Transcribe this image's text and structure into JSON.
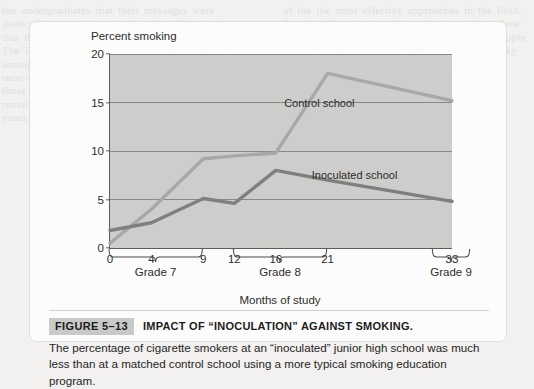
{
  "figure": {
    "number": "FIGURE 5–13",
    "title": "IMPACT OF “INOCULATION” AGAINST SMOKING.",
    "caption": "The percentage of cigarette smokers at an “inoculated” junior high school was much less than at a matched control school using a more typical smoking education program."
  },
  "chart_data": {
    "type": "line",
    "title": "",
    "xlabel": "Months of study",
    "ylabel": "Percent smoking",
    "x": [
      0,
      4,
      9,
      12,
      16,
      21,
      33
    ],
    "xtick_labels": [
      "0",
      "4",
      "9",
      "12",
      "16",
      "21",
      "33"
    ],
    "xlim": [
      0,
      33
    ],
    "ylim": [
      0,
      20
    ],
    "yticks": [
      0,
      5,
      10,
      15,
      20
    ],
    "ytick_labels": [
      "0",
      "5",
      "10",
      "15",
      "20"
    ],
    "grid": "horizontal",
    "legend_position": "inline-annotation",
    "plot_background": "#cdcdcb",
    "series": [
      {
        "name": "Control school",
        "color": "#a8a8a6",
        "values": [
          0.5,
          4.0,
          9.2,
          9.5,
          9.8,
          18.0,
          15.2
        ],
        "label_x": 20.2,
        "label_y": 15.0
      },
      {
        "name": "Inoculated school",
        "color": "#807f7d",
        "values": [
          1.8,
          2.6,
          5.1,
          4.6,
          8.0,
          7.0,
          4.8
        ],
        "label_x": 23.6,
        "label_y": 7.55
      }
    ],
    "group_brackets": [
      {
        "label": "Grade 7",
        "from": 0,
        "to": 9
      },
      {
        "label": "Grade 8",
        "from": 12,
        "to": 21
      },
      {
        "label": "Grade 9",
        "from": 31.2,
        "to": 34.8
      }
    ]
  },
  "page_bleed": {
    "left": "the undergraduates that their messages were insincere or were wrong about the effects and that they could hold on to their own opinions. The inoculation technique also works in real-life settings. Researchers found that students who received inoculation training smoked less than those who did not, and their attitudes also remained more negative toward smoking in later years.",
    "right": "of the the most effective approaches in the field. Social influence research continues to shape how educators design programs that help young people resist pressure to begin smoking and other risky behaviours, and these findings remain widely cited."
  }
}
